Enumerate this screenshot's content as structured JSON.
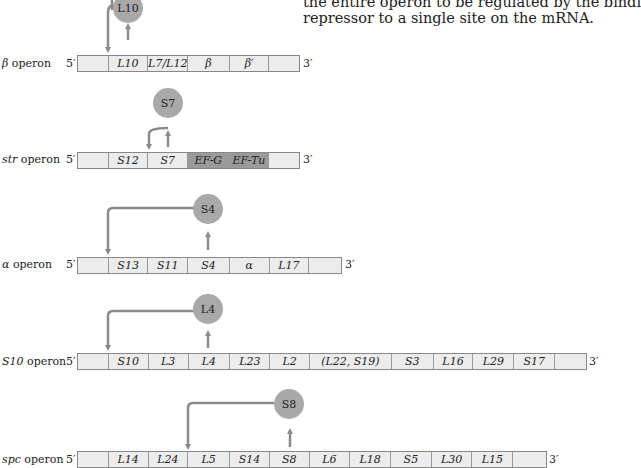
{
  "caption": {
    "line1": "the entire operon to be regulated by the bindi",
    "line2": "repressor to a single site on the mRNA."
  },
  "colors": {
    "cell_fill": "#ececec",
    "cell_dark_fill": "#9a9a9a",
    "repressor_fill": "#a9a9a9",
    "arrow": "#8a8a8a"
  },
  "end_labels": {
    "five_prime": "5′",
    "three_prime": "3′"
  },
  "operons": [
    {
      "name_prefix": "β",
      "name_suffix": " operon",
      "repressor": "L10",
      "genes": [
        "",
        "L10",
        "L7/L12",
        "β",
        "β′",
        ""
      ]
    },
    {
      "name_prefix": "str",
      "name_suffix": " operon",
      "repressor": "S7",
      "genes": [
        "",
        "S12",
        "S7",
        "EF-G",
        "EF-Tu",
        ""
      ],
      "dark_genes": [
        "EF-G",
        "EF-Tu"
      ]
    },
    {
      "name_prefix": "α",
      "name_suffix": " operon",
      "repressor": "S4",
      "genes": [
        "",
        "S13",
        "S11",
        "S4",
        "α",
        "L17",
        ""
      ]
    },
    {
      "name_prefix": "S10",
      "name_suffix": " operon",
      "repressor": "L4",
      "genes": [
        "",
        "S10",
        "L3",
        "L4",
        "L23",
        "L2",
        "(L22, S19)",
        "S3",
        "L16",
        "L29",
        "S17",
        ""
      ]
    },
    {
      "name_prefix": "spc",
      "name_suffix": " operon",
      "repressor": "S8",
      "genes": [
        "",
        "L14",
        "L24",
        "L5",
        "S14",
        "S8",
        "L6",
        "L18",
        "S5",
        "L30",
        "L15",
        ""
      ]
    }
  ]
}
